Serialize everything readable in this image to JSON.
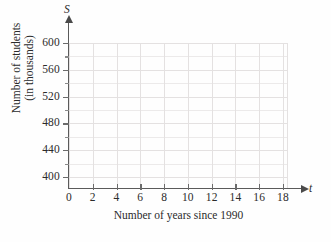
{
  "chart_data": {
    "type": "scatter",
    "title": "",
    "xlabel": "Number of years since 1990",
    "ylabel": "Number of students (in thousands)",
    "ylabel_line1": "Number of students",
    "ylabel_line2": "(in thousands)",
    "x_variable": "t",
    "y_variable": "S",
    "xlim": [
      0,
      19.5
    ],
    "ylim": [
      380,
      610
    ],
    "x_ticks": [
      0,
      2,
      4,
      6,
      8,
      10,
      12,
      14,
      16,
      18
    ],
    "x_tick_labels": [
      "0",
      "2",
      "4",
      "6",
      "8",
      "10",
      "12",
      "14",
      "16",
      "18"
    ],
    "x_minor_step": 2,
    "y_ticks": [
      400,
      440,
      480,
      520,
      560,
      600
    ],
    "y_tick_labels": [
      "400",
      "440",
      "480",
      "520",
      "560",
      "600"
    ],
    "y_minor_ticks": [
      420,
      460,
      500,
      540,
      580
    ],
    "y_minor_step": 20,
    "grid": true,
    "grid_color": "#ebe9e9",
    "axis_color": "#5a5a5a",
    "background_color": "#fefefe",
    "legend": null,
    "series": [],
    "values": [],
    "annotations": [],
    "note": "Empty coordinate grid — no data plotted"
  }
}
